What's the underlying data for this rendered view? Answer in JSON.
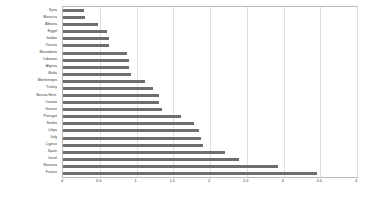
{
  "chart_data": {
    "type": "bar",
    "orientation": "horizontal",
    "title": "",
    "subtitle": "",
    "xlabel": "",
    "ylabel": "",
    "xlim": [
      0,
      4
    ],
    "ylim": null,
    "grid": true,
    "grid_axis": "x",
    "legend": false,
    "legend_position": "none",
    "bar_color": "#6e6e6e",
    "grid_color": "#dedede",
    "frame_color": "#b9b9b9",
    "background": "#ffffff",
    "xticks": [
      0,
      0.5,
      1,
      1.5,
      2,
      2.5,
      3,
      3.5,
      4
    ],
    "xtick_labels": [
      "0",
      "0.5",
      "1",
      "1.5",
      "2",
      "2.5",
      "3",
      "3.5",
      "4"
    ],
    "categories": [
      "Syria",
      "Morocco",
      "Albania",
      "Egypt",
      "Jordan",
      "Tunisia",
      "Macedonia",
      "Lebanon",
      "Algeria",
      "Malta",
      "Montenegro",
      "Turkey",
      "Bosnia-Herz.",
      "Croatia",
      "Greece",
      "Portugal",
      "Serbia",
      "Libya",
      "Italy",
      "Cyprus",
      "Spain",
      "Israel",
      "Slovenia",
      "France"
    ],
    "values": [
      0.28,
      0.3,
      0.47,
      0.6,
      0.62,
      0.62,
      0.87,
      0.9,
      0.9,
      0.92,
      1.11,
      1.23,
      1.3,
      1.3,
      1.35,
      1.6,
      1.78,
      1.85,
      1.88,
      1.9,
      2.2,
      2.4,
      2.92,
      3.45
    ]
  }
}
